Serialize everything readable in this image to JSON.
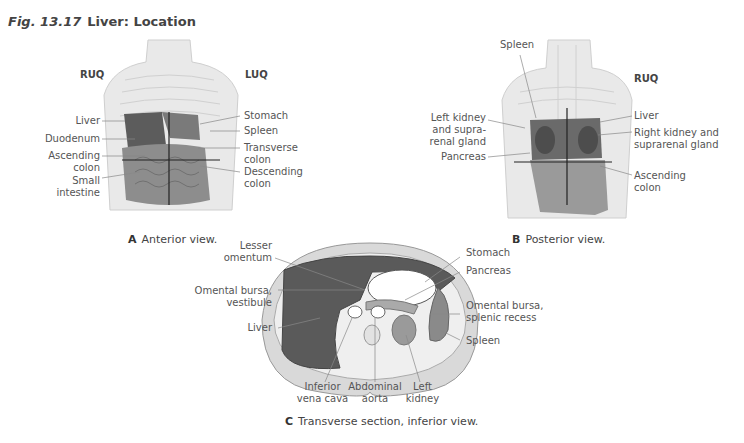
{
  "figure": {
    "number": "Fig. 13.17",
    "title": "Liver: Location"
  },
  "panel_a": {
    "letter": "A",
    "caption": "Anterior view.",
    "quadrants": {
      "left": "RUQ",
      "right": "LUQ"
    },
    "labels_left": [
      "Liver",
      "Duodenum",
      "Ascending colon",
      "Small intestine"
    ],
    "labels_right": [
      "Stomach",
      "Spleen",
      "Transverse colon",
      "Descending colon"
    ]
  },
  "panel_b": {
    "letter": "B",
    "caption": "Posterior view.",
    "quadrants": {
      "right": "RUQ"
    },
    "labels_top": [
      "Spleen"
    ],
    "labels_left": [
      "Left kidney and supra-renal gland",
      "Pancreas"
    ],
    "labels_right": [
      "Liver",
      "Right kidney and suprarenal gland",
      "Ascending colon"
    ]
  },
  "panel_c": {
    "letter": "C",
    "caption": "Transverse section, inferior view.",
    "labels_left": [
      "Lesser omentum",
      "Omental bursa, vestibule",
      "Liver"
    ],
    "labels_right": [
      "Stomach",
      "Pancreas",
      "Omental bursa, splenic recess",
      "Spleen"
    ],
    "labels_bottom": [
      "Inferior vena cava",
      "Abdominal aorta",
      "Left kidney"
    ]
  },
  "colors": {
    "organ_dark": "#5a5a5a",
    "organ_mid": "#8a8a8a",
    "body_light": "#e6e6e6",
    "text": "#555555"
  }
}
